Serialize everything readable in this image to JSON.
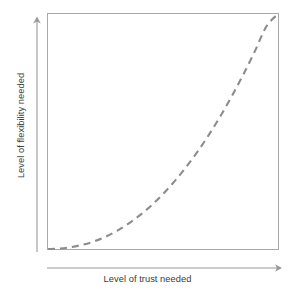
{
  "chart_data": {
    "type": "line",
    "title": "",
    "subtitle": "",
    "xlabel": "Level of trust needed",
    "ylabel": "Level of flexibility needed",
    "xlim": [
      0,
      1
    ],
    "ylim": [
      0,
      1
    ],
    "grid": false,
    "legend": null,
    "xticklabels": [],
    "yticklabels": [],
    "annotations": [],
    "axis_style": {
      "x_axis_arrow": true,
      "y_axis_arrow": true,
      "plot_frame": true,
      "frame_color": "#a8a8a8",
      "axis_arrow_color": "#9a9a9a"
    },
    "series": [
      {
        "name": "trust-flexibility relationship",
        "style": "dashed",
        "color": "#8c8c8c",
        "linewidth": 2.1,
        "dash_pattern": [
          7,
          5
        ],
        "relationship": "exponential / convex increasing (y = x^2.1)",
        "x": [
          0.0,
          0.05,
          0.1,
          0.15,
          0.2,
          0.25,
          0.3,
          0.35,
          0.4,
          0.45,
          0.5,
          0.55,
          0.6,
          0.65,
          0.7,
          0.75,
          0.8,
          0.85,
          0.9,
          0.95,
          1.0
        ],
        "y": [
          0.0,
          0.002,
          0.008,
          0.018,
          0.032,
          0.052,
          0.077,
          0.108,
          0.144,
          0.186,
          0.234,
          0.288,
          0.348,
          0.414,
          0.487,
          0.566,
          0.652,
          0.744,
          0.843,
          0.948,
          1.0
        ]
      }
    ]
  },
  "colors": {
    "background": "#ffffff",
    "frame": "#a8a8a8",
    "axis": "#9a9a9a",
    "curve": "#8c8c8c",
    "label_text": "#3b3b3b"
  }
}
